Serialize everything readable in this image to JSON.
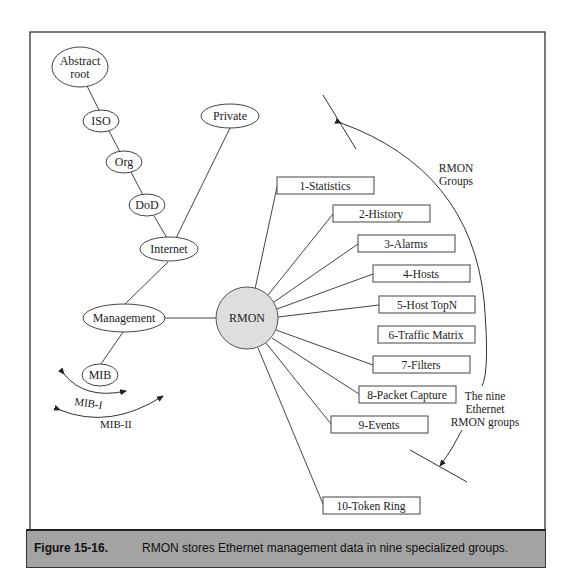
{
  "figure": {
    "label": "Figure 15-16.",
    "caption": "RMON stores Ethernet management data in nine specialized groups."
  },
  "tree": {
    "nodes": [
      {
        "id": "abstract_root",
        "line1": "Abstract",
        "line2": "root"
      },
      {
        "id": "iso",
        "label": "ISO"
      },
      {
        "id": "org",
        "label": "Org"
      },
      {
        "id": "dod",
        "label": "DoD"
      },
      {
        "id": "internet",
        "label": "Internet"
      },
      {
        "id": "private",
        "label": "Private"
      },
      {
        "id": "management",
        "label": "Management"
      },
      {
        "id": "mib",
        "label": "MIB"
      },
      {
        "id": "rmon",
        "label": "RMON"
      }
    ],
    "mib_ranges": [
      {
        "id": "mib1",
        "label": "MIB-I"
      },
      {
        "id": "mib2",
        "label": "MIB-II"
      }
    ]
  },
  "rmon_groups": [
    {
      "num": 1,
      "label": "1-Statistics"
    },
    {
      "num": 2,
      "label": "2-History"
    },
    {
      "num": 3,
      "label": "3-Alarms"
    },
    {
      "num": 4,
      "label": "4-Hosts"
    },
    {
      "num": 5,
      "label": "5-Host TopN"
    },
    {
      "num": 6,
      "label": "6-Traffic Matrix"
    },
    {
      "num": 7,
      "label": "7-Filters"
    },
    {
      "num": 8,
      "label": "8-Packet Capture"
    },
    {
      "num": 9,
      "label": "9-Events"
    },
    {
      "num": 10,
      "label": "10-Token Ring"
    }
  ],
  "annotations": {
    "rmon_groups_line1": "RMON",
    "rmon_groups_line2": "Groups",
    "nine_line1": "The nine",
    "nine_line2": "Ethernet",
    "nine_line3": "RMON groups"
  },
  "colors": {
    "rmon_fill": "#dedede",
    "caption_bg": "#a3a3a3",
    "stroke": "#333333"
  }
}
